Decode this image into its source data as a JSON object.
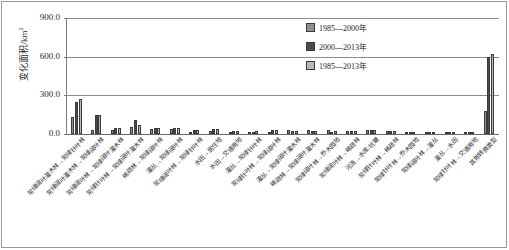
{
  "chart_data": {
    "type": "bar",
    "title": "",
    "xlabel": "",
    "ylabel": "变化面积/km²",
    "ylim": [
      0,
      900
    ],
    "yticks": [
      "0.0",
      "300.0",
      "600.0",
      "900.0"
    ],
    "ytick_values": [
      0,
      300,
      600,
      900
    ],
    "grid": true,
    "legend_position": "top-center-right",
    "categories": [
      "常绿阔叶灌木林→常绿针叶林",
      "常绿阔叶灌木林→常绿阔叶林",
      "常绿阔叶林→常绿阔叶灌木林",
      "常绿针叶林→常绿阔叶灌木林",
      "稀疏林→常绿阔叶林",
      "灌丛→常绿阔叶林",
      "常绿阔叶林→常绿针叶林",
      "水田→居住地",
      "水田→交通用地",
      "灌丛→常绿针叶林",
      "常绿针叶林→常绿阔叶林",
      "灌丛→常绿阔叶灌木林",
      "稀疏林→常绿阔叶灌木林",
      "常绿阔叶林→乔木园地",
      "常绿阔叶林→稀疏林",
      "河流→水库/坑塘",
      "常绿针叶林→稀疏林",
      "常绿针叶林→乔木园地",
      "常绿阔叶林→灌丛",
      "灌丛→水田",
      "常绿针叶林→交通用地",
      "其他转换类型"
    ],
    "series": [
      {
        "name": "1985—2000年",
        "color": "#8f8f8f",
        "values": [
          130,
          28,
          35,
          52,
          38,
          38,
          12,
          20,
          10,
          10,
          8,
          28,
          30,
          28,
          25,
          30,
          25,
          16,
          14,
          10,
          8,
          180
        ]
      },
      {
        "name": "2000—2013年",
        "color": "#4a4a4a",
        "values": [
          245,
          150,
          48,
          105,
          45,
          45,
          28,
          42,
          25,
          18,
          28,
          22,
          22,
          18,
          22,
          28,
          20,
          18,
          12,
          14,
          12,
          600
        ]
      },
      {
        "name": "1985—2013年",
        "color": "#b9b9b9",
        "values": [
          272,
          150,
          48,
          72,
          48,
          48,
          32,
          42,
          25,
          20,
          30,
          25,
          25,
          22,
          25,
          30,
          22,
          18,
          14,
          16,
          14,
          620
        ]
      }
    ]
  },
  "legend": {
    "items": [
      {
        "label": "1985—2000年",
        "swatch": "s0"
      },
      {
        "label": "2000—2013年",
        "swatch": "s1"
      },
      {
        "label": "1985—2013年",
        "swatch": "s2"
      }
    ]
  },
  "axis": {
    "y_title": "变化面积/km²"
  }
}
